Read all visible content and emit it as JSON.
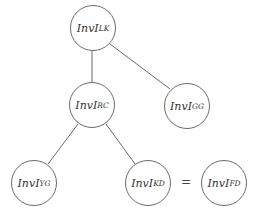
{
  "diagram": {
    "type": "tree",
    "nodes": [
      {
        "id": "LK",
        "base": "InvI",
        "sub": "LK",
        "cx": 93,
        "cy": 28
      },
      {
        "id": "RC",
        "base": "InvI",
        "sub": "RC",
        "cx": 92,
        "cy": 105
      },
      {
        "id": "GG",
        "base": "InvI",
        "sub": "GG",
        "cx": 187,
        "cy": 106
      },
      {
        "id": "YG",
        "base": "InvI",
        "sub": "YG",
        "cx": 34,
        "cy": 183
      },
      {
        "id": "KD",
        "base": "InvI",
        "sub": "KD",
        "cx": 148,
        "cy": 183
      },
      {
        "id": "FD",
        "base": "InvI",
        "sub": "FD",
        "cx": 224,
        "cy": 183
      }
    ],
    "edges": [
      {
        "from": "LK",
        "to": "RC"
      },
      {
        "from": "LK",
        "to": "GG"
      },
      {
        "from": "RC",
        "to": "YG"
      },
      {
        "from": "RC",
        "to": "KD"
      }
    ],
    "equivalence": {
      "left": "KD",
      "right": "FD",
      "symbol": "="
    }
  }
}
